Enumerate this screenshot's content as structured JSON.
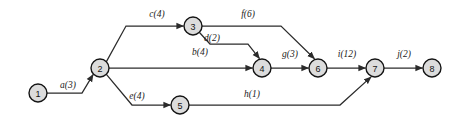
{
  "diagram": {
    "type": "activity-on-arrow-network",
    "title": "",
    "canvas": {
      "width": 468,
      "height": 128,
      "background": "#ffffff"
    },
    "style": {
      "node_fill": "#dcdcdc",
      "node_stroke": "#141414",
      "edge_stroke": "#2b2b2b",
      "label_color": "#1a1a1a"
    },
    "nodes": [
      {
        "id": "n1",
        "label": "1",
        "x": 38,
        "y": 93,
        "r": 9
      },
      {
        "id": "n2",
        "label": "2",
        "x": 100,
        "y": 68,
        "r": 9
      },
      {
        "id": "n3",
        "label": "3",
        "x": 193,
        "y": 26,
        "r": 9
      },
      {
        "id": "n4",
        "label": "4",
        "x": 262,
        "y": 68,
        "r": 9
      },
      {
        "id": "n5",
        "label": "5",
        "x": 180,
        "y": 105,
        "r": 9
      },
      {
        "id": "n6",
        "label": "6",
        "x": 318,
        "y": 68,
        "r": 9
      },
      {
        "id": "n7",
        "label": "7",
        "x": 375,
        "y": 68,
        "r": 9
      },
      {
        "id": "n8",
        "label": "8",
        "x": 432,
        "y": 68,
        "r": 9
      }
    ],
    "edges": [
      {
        "id": "e-a",
        "activity": "a",
        "duration": 3,
        "label": "a(3)",
        "from": "n1",
        "to": "n2",
        "label_x": 68,
        "label_y": 88,
        "path": "M 47 93 L 82 93 L 93.1 74.6"
      },
      {
        "id": "e-c",
        "activity": "c",
        "duration": 4,
        "label": "c(4)",
        "from": "n2",
        "to": "n3",
        "label_x": 157,
        "label_y": 17,
        "path": "M 106.4 61.6 L 126 26 L 183.5 26"
      },
      {
        "id": "e-b",
        "activity": "b",
        "duration": 4,
        "label": "b(4)",
        "from": "n2",
        "to": "n4",
        "label_x": 200,
        "label_y": 55,
        "path": "M 109 68 L 252.5 68"
      },
      {
        "id": "e-e",
        "activity": "e",
        "duration": 4,
        "label": "e(4)",
        "from": "n2",
        "to": "n5",
        "label_x": 137,
        "label_y": 99,
        "path": "M 106.4 74.4 L 132 105 L 170.5 105"
      },
      {
        "id": "e-d",
        "activity": "d",
        "duration": 2,
        "label": "d(2)",
        "from": "n3",
        "to": "n4",
        "label_x": 212,
        "label_y": 41,
        "path": "M 199.5 32.5 L 210 44 L 248 44 L 259.5 58.6"
      },
      {
        "id": "e-f",
        "activity": "f",
        "duration": 6,
        "label": "f(6)",
        "from": "n3",
        "to": "n6",
        "label_x": 248,
        "label_y": 17,
        "path": "M 202 26 L 281 26 L 314.5 58.7"
      },
      {
        "id": "e-g",
        "activity": "g",
        "duration": 3,
        "label": "g(3)",
        "from": "n4",
        "to": "n6",
        "label_x": 290,
        "label_y": 57,
        "path": "M 271 68 L 308.5 68"
      },
      {
        "id": "e-h",
        "activity": "h",
        "duration": 1,
        "label": "h(1)",
        "from": "n5",
        "to": "n7",
        "label_x": 252,
        "label_y": 97,
        "path": "M 189 105 L 340 105 L 371.1 76.9"
      },
      {
        "id": "e-i",
        "activity": "i",
        "duration": 12,
        "label": "i(12)",
        "from": "n6",
        "to": "n7",
        "label_x": 347,
        "label_y": 57,
        "path": "M 327 68 L 365.5 68"
      },
      {
        "id": "e-j",
        "activity": "j",
        "duration": 2,
        "label": "j(2)",
        "from": "n7",
        "to": "n8",
        "label_x": 404,
        "label_y": 57,
        "path": "M 384 68 L 422.5 68"
      }
    ]
  }
}
